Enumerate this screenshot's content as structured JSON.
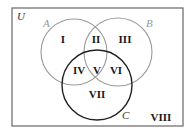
{
  "diagram": {
    "type": "venn",
    "universe_label": "U",
    "sets": [
      {
        "name": "A",
        "color": "#9a9a9a"
      },
      {
        "name": "B",
        "color": "#9a9a9a"
      },
      {
        "name": "C",
        "color": "#222222"
      }
    ],
    "regions": [
      "I",
      "II",
      "III",
      "IV",
      "V",
      "VI",
      "VII",
      "VIII"
    ]
  }
}
